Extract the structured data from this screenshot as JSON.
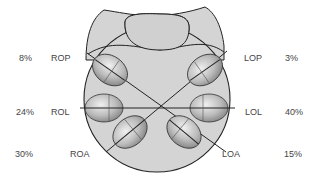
{
  "diagram": {
    "type": "fetal-head-positions-pelvic-inlet",
    "positions": [
      {
        "code": "ROP",
        "percent": "8%",
        "side": "left",
        "row": "top"
      },
      {
        "code": "ROL",
        "percent": "24%",
        "side": "left",
        "row": "middle"
      },
      {
        "code": "ROA",
        "percent": "30%",
        "side": "left",
        "row": "bottom"
      },
      {
        "code": "LOP",
        "percent": "3%",
        "side": "right",
        "row": "top"
      },
      {
        "code": "LOL",
        "percent": "40%",
        "side": "right",
        "row": "middle"
      },
      {
        "code": "LOA",
        "percent": "15%",
        "side": "right",
        "row": "bottom"
      }
    ],
    "colors": {
      "pelvis_fill": "#d4d4d4",
      "outline": "#222222",
      "head_light": "#e6e6e6",
      "head_dark": "#8a8a8a",
      "label_text": "#444444"
    }
  }
}
